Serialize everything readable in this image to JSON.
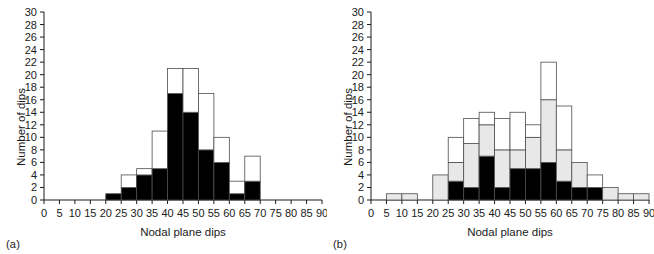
{
  "figure": {
    "panels": [
      {
        "id": "a",
        "tag": "(a)"
      },
      {
        "id": "b",
        "tag": "(b)"
      }
    ]
  },
  "chart_data": [
    {
      "type": "bar",
      "title": "",
      "panel": "(a)",
      "xlabel": "Nodal plane dips",
      "ylabel": "Number of dips",
      "xlim": [
        0,
        90
      ],
      "ylim": [
        0,
        30
      ],
      "xticks": [
        0,
        5,
        10,
        15,
        20,
        25,
        30,
        35,
        40,
        45,
        50,
        55,
        60,
        65,
        70,
        75,
        80,
        85,
        90
      ],
      "yticks": [
        0,
        2,
        4,
        6,
        8,
        10,
        12,
        14,
        16,
        18,
        20,
        22,
        24,
        26,
        28,
        30
      ],
      "bin_width": 5,
      "grid": false,
      "legend": "none",
      "stacked": true,
      "bin_starts": [
        0,
        5,
        10,
        15,
        20,
        25,
        30,
        35,
        40,
        45,
        50,
        55,
        60,
        65,
        70,
        75,
        80,
        85
      ],
      "series": [
        {
          "name": "black",
          "color": "#000000",
          "values": [
            0,
            0,
            0,
            0,
            1,
            2,
            4,
            5,
            17,
            14,
            8,
            6,
            1,
            3,
            0,
            0,
            0,
            0
          ]
        },
        {
          "name": "white",
          "color": "#ffffff",
          "values": [
            0,
            0,
            0,
            0,
            0,
            2,
            1,
            6,
            4,
            7,
            9,
            4,
            2,
            4,
            0,
            0,
            0,
            0
          ]
        }
      ],
      "totals": [
        0,
        0,
        0,
        0,
        1,
        4,
        5,
        11,
        21,
        21,
        17,
        10,
        3,
        7,
        0,
        0,
        0,
        0
      ]
    },
    {
      "type": "bar",
      "title": "",
      "panel": "(b)",
      "xlabel": "Nodal plane dips",
      "ylabel": "Number of dips",
      "xlim": [
        0,
        90
      ],
      "ylim": [
        0,
        30
      ],
      "xticks": [
        0,
        5,
        10,
        15,
        20,
        25,
        30,
        35,
        40,
        45,
        50,
        55,
        60,
        65,
        70,
        75,
        80,
        85,
        90
      ],
      "yticks": [
        0,
        2,
        4,
        6,
        8,
        10,
        12,
        14,
        16,
        18,
        20,
        22,
        24,
        26,
        28,
        30
      ],
      "bin_width": 5,
      "grid": false,
      "legend": "none",
      "stacked": true,
      "bin_starts": [
        0,
        5,
        10,
        15,
        20,
        25,
        30,
        35,
        40,
        45,
        50,
        55,
        60,
        65,
        70,
        75,
        80,
        85
      ],
      "series": [
        {
          "name": "black",
          "color": "#000000",
          "values": [
            0,
            0,
            0,
            0,
            0,
            3,
            2,
            7,
            2,
            5,
            5,
            6,
            3,
            2,
            2,
            0,
            0,
            0
          ]
        },
        {
          "name": "gray",
          "color": "#e8e8e8",
          "values": [
            0,
            1,
            1,
            0,
            4,
            3,
            7,
            5,
            6,
            3,
            5,
            10,
            5,
            4,
            0,
            2,
            1,
            1
          ]
        },
        {
          "name": "white",
          "color": "#ffffff",
          "values": [
            0,
            0,
            0,
            0,
            0,
            4,
            4,
            2,
            5,
            6,
            2,
            6,
            7,
            0,
            2,
            0,
            0,
            0
          ]
        }
      ],
      "totals": [
        0,
        1,
        1,
        0,
        4,
        10,
        13,
        14,
        13,
        14,
        12,
        22,
        15,
        6,
        4,
        2,
        1,
        1
      ]
    }
  ]
}
